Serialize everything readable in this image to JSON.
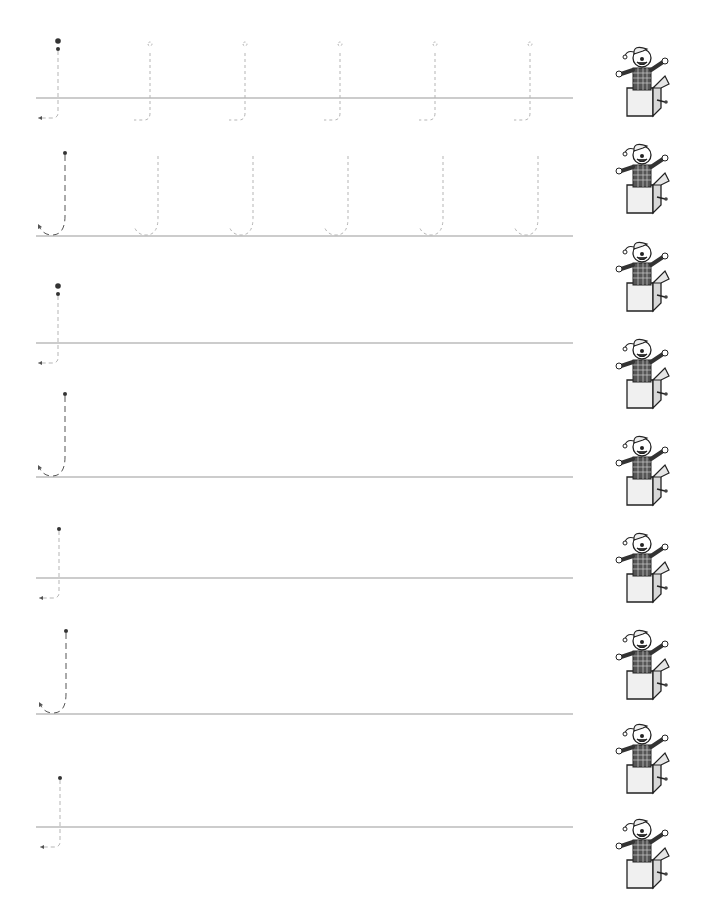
{
  "worksheet": {
    "letter": "J",
    "line_color": "#9a9a9a",
    "trace_color": "#b5b5b5",
    "guide_color": "#555555",
    "dot_color": "#333333",
    "line_x_start": 36,
    "line_x_end": 573,
    "rows": [
      {
        "type": "lowercase-j",
        "baseline_y": 98,
        "guide_x": 58,
        "trace_x": [
          150,
          245,
          340,
          435,
          530
        ]
      },
      {
        "type": "uppercase-J",
        "baseline_y": 236,
        "guide_x": 65,
        "trace_x": [
          158,
          253,
          348,
          443,
          538
        ]
      },
      {
        "type": "lowercase-j",
        "baseline_y": 343,
        "guide_x": 58,
        "trace_x": []
      },
      {
        "type": "uppercase-J",
        "baseline_y": 477,
        "guide_x": 65,
        "trace_x": []
      },
      {
        "type": "lowercase-j-no-dot",
        "baseline_y": 578,
        "guide_x": 59,
        "trace_x": []
      },
      {
        "type": "uppercase-J",
        "baseline_y": 714,
        "guide_x": 66,
        "trace_x": []
      },
      {
        "type": "lowercase-j-no-dot",
        "baseline_y": 827,
        "guide_x": 60,
        "trace_x": []
      }
    ],
    "illustrations": [
      {
        "icon": "jack-in-the-box-icon",
        "x": 613,
        "y": 40
      },
      {
        "icon": "jack-in-the-box-icon",
        "x": 613,
        "y": 137
      },
      {
        "icon": "jack-in-the-box-icon",
        "x": 613,
        "y": 235
      },
      {
        "icon": "jack-in-the-box-icon",
        "x": 613,
        "y": 332
      },
      {
        "icon": "jack-in-the-box-icon",
        "x": 613,
        "y": 429
      },
      {
        "icon": "jack-in-the-box-icon",
        "x": 613,
        "y": 526
      },
      {
        "icon": "jack-in-the-box-icon",
        "x": 613,
        "y": 623
      },
      {
        "icon": "jack-in-the-box-icon",
        "x": 613,
        "y": 717
      },
      {
        "icon": "jack-in-the-box-icon",
        "x": 613,
        "y": 812
      }
    ]
  }
}
